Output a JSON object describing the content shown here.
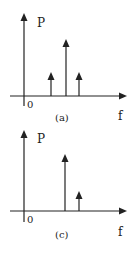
{
  "diagrams": [
    {
      "id": "a",
      "caption": "(a)",
      "y_label": "P",
      "x_label": "f",
      "origin_label": "0",
      "spikes": [
        {
          "position": 1,
          "height": "medium-low"
        },
        {
          "position": 2,
          "height": "high"
        },
        {
          "position": 3,
          "height": "medium-low"
        }
      ]
    },
    {
      "id": "c",
      "caption": "(c)",
      "y_label": "P",
      "x_label": "f",
      "origin_label": "0",
      "spikes": [
        {
          "position": 2,
          "height": "high"
        },
        {
          "position": 3,
          "height": "low"
        }
      ]
    }
  ],
  "colors": {
    "stroke": "#222222",
    "background": "#ffffff"
  }
}
